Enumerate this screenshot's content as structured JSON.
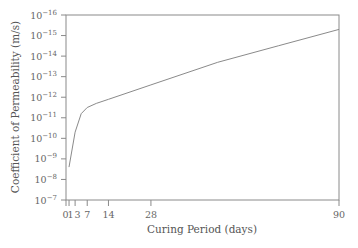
{
  "chart_data": {
    "type": "line",
    "title": "",
    "xlabel": "Curing Period (days)",
    "ylabel": "Coefficient of Permeability (m/s)",
    "xlim": [
      0,
      90
    ],
    "ylim_exponent": [
      -7,
      -16
    ],
    "y_scale": "log (inverted: 10^-7 at bottom, 10^-16 at top)",
    "x_ticks": [
      0,
      1,
      3,
      7,
      14,
      28,
      90
    ],
    "x_tick_labels": [
      "0",
      "1",
      "3",
      "7",
      "14",
      "28",
      "90"
    ],
    "y_ticks_exponents": [
      -7,
      -8,
      -9,
      -10,
      -11,
      -12,
      -13,
      -14,
      -15,
      -16
    ],
    "y_tick_labels": [
      "10⁻⁷",
      "10⁻⁸",
      "10⁻⁹",
      "10⁻¹⁰",
      "10⁻¹¹",
      "10⁻¹²",
      "10⁻¹³",
      "10⁻¹⁴",
      "10⁻¹⁵",
      "10⁻¹⁶"
    ],
    "grid": false,
    "legend": null,
    "series": [
      {
        "name": "Permeability",
        "x": [
          1,
          3,
          5,
          7,
          10,
          14,
          28,
          50,
          70,
          90
        ],
        "y_exponent": [
          -8.6,
          -10.3,
          -11.2,
          -11.5,
          -11.7,
          -11.9,
          -12.6,
          -13.7,
          -14.5,
          -15.3
        ]
      }
    ]
  },
  "axes": {
    "x_title": "Curing Period (days)",
    "y_title": "Coefficient of Permeability (m/s)"
  }
}
